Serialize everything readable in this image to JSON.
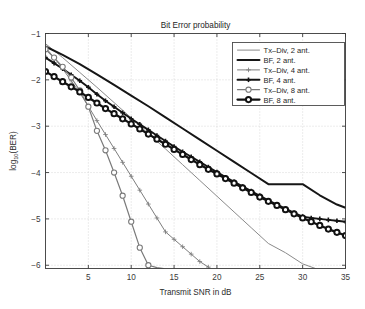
{
  "chart_data": {
    "type": "line",
    "title": "Bit Error probability",
    "xlabel": "Transmit SNR in dB",
    "ylabel": "log10(BER)",
    "ylabel_parts": {
      "base": "log",
      "sub": "10",
      "tail": "(BER)"
    },
    "xlim": [
      0,
      35
    ],
    "ylim": [
      -6.07,
      -1.0
    ],
    "xticks": [
      5,
      10,
      15,
      20,
      25,
      30,
      35
    ],
    "xtick_labels": [
      "5",
      "10",
      "15",
      "20",
      "25",
      "30",
      "35"
    ],
    "yticks": [
      -1,
      -2,
      -3,
      -4,
      -5,
      -6
    ],
    "ytick_labels": [
      "-1",
      "-2",
      "-3",
      "-4",
      "-5",
      "-6"
    ],
    "grid": true,
    "grid_style": "dotted",
    "grid_color": "#c8c8c8",
    "legend_position": "upper right",
    "series": [
      {
        "name": "Tx-Div, 2 ant.",
        "color": "#8a8a8a",
        "width": 1.0,
        "marker": "none",
        "x": [
          0,
          2,
          4,
          6,
          8,
          10,
          12,
          14,
          16,
          18,
          20,
          22,
          24,
          26,
          28,
          30,
          31.5
        ],
        "values": [
          -1.22,
          -1.52,
          -1.84,
          -2.16,
          -2.49,
          -2.82,
          -3.16,
          -3.49,
          -3.83,
          -4.17,
          -4.51,
          -4.85,
          -5.19,
          -5.53,
          -5.73,
          -5.97,
          -6.07
        ]
      },
      {
        "name": "BF, 2 ant.",
        "color": "#161616",
        "width": 2.0,
        "marker": "none",
        "x": [
          0,
          2,
          4,
          6,
          8,
          10,
          12,
          14,
          16,
          18,
          20,
          22,
          24,
          26,
          28,
          30,
          32,
          34,
          35
        ],
        "values": [
          -1.28,
          -1.46,
          -1.66,
          -1.88,
          -2.11,
          -2.34,
          -2.57,
          -2.81,
          -3.05,
          -3.29,
          -3.53,
          -3.77,
          -4.01,
          -4.25,
          -4.25,
          -4.25,
          -4.49,
          -4.69,
          -4.76
        ]
      },
      {
        "name": "Tx-Div, 4 ant.",
        "color": "#7d7d7d",
        "width": 1.0,
        "marker": "plus",
        "x": [
          0,
          1,
          2,
          3,
          4,
          5,
          6,
          7,
          8,
          9,
          10,
          11,
          12,
          13,
          14,
          15,
          16,
          17,
          18,
          19,
          19.2
        ],
        "values": [
          -1.3,
          -1.52,
          -1.76,
          -2.02,
          -2.28,
          -2.57,
          -2.88,
          -3.18,
          -3.48,
          -3.78,
          -4.08,
          -4.38,
          -4.68,
          -4.98,
          -5.28,
          -5.44,
          -5.6,
          -5.76,
          -5.92,
          -6.04,
          -6.07
        ]
      },
      {
        "name": "BF, 4 ant.",
        "color": "#141414",
        "width": 1.9,
        "marker": "plus",
        "x": [
          0,
          1,
          2,
          3,
          4,
          5,
          6,
          7,
          8,
          9,
          10,
          11,
          12,
          13,
          14,
          15,
          16,
          17,
          18,
          19,
          20,
          21,
          22,
          23,
          24,
          25,
          26,
          27,
          28,
          29,
          30,
          31,
          32,
          33,
          34,
          35
        ],
        "values": [
          -1.52,
          -1.64,
          -1.76,
          -1.89,
          -2.02,
          -2.16,
          -2.31,
          -2.45,
          -2.58,
          -2.71,
          -2.84,
          -2.96,
          -3.08,
          -3.2,
          -3.32,
          -3.44,
          -3.55,
          -3.66,
          -3.77,
          -3.88,
          -3.99,
          -4.1,
          -4.2,
          -4.3,
          -4.4,
          -4.5,
          -4.6,
          -4.69,
          -4.78,
          -4.87,
          -4.95,
          -4.98,
          -5.0,
          -5.02,
          -5.04,
          -5.06
        ]
      },
      {
        "name": "Tx-Div, 8 ant.",
        "color": "#7a7a7a",
        "width": 1.2,
        "marker": "circle",
        "x": [
          0,
          1,
          2,
          3,
          4,
          5,
          6,
          7,
          8,
          9,
          10,
          11,
          12,
          13,
          13.8
        ],
        "values": [
          -1.34,
          -1.52,
          -1.72,
          -1.95,
          -2.23,
          -2.58,
          -3.1,
          -3.52,
          -4.0,
          -4.5,
          -5.06,
          -5.62,
          -6.0,
          -6.05,
          -6.07
        ]
      },
      {
        "name": "BF, 8 ant.",
        "color": "#111111",
        "width": 2.2,
        "marker": "circle",
        "x": [
          0,
          1,
          2,
          3,
          4,
          5,
          6,
          7,
          8,
          9,
          10,
          11,
          12,
          13,
          14,
          15,
          16,
          17,
          18,
          19,
          20,
          21,
          22,
          23,
          24,
          25,
          26,
          27,
          28,
          29,
          30,
          31,
          32,
          33,
          34,
          35
        ],
        "values": [
          -1.82,
          -1.93,
          -2.04,
          -2.15,
          -2.26,
          -2.38,
          -2.5,
          -2.62,
          -2.73,
          -2.84,
          -2.95,
          -3.06,
          -3.17,
          -3.28,
          -3.39,
          -3.5,
          -3.61,
          -3.72,
          -3.83,
          -3.93,
          -4.03,
          -4.13,
          -4.23,
          -4.33,
          -4.43,
          -4.53,
          -4.62,
          -4.71,
          -4.8,
          -4.89,
          -4.98,
          -5.06,
          -5.14,
          -5.22,
          -5.29,
          -5.36
        ]
      }
    ]
  },
  "legend": {
    "items": [
      {
        "label": "Tx-Div, 2 ant."
      },
      {
        "label": "BF, 2 ant."
      },
      {
        "label": "Tx-Div, 4 ant."
      },
      {
        "label": "BF, 4 ant."
      },
      {
        "label": "Tx-Div, 8 ant."
      },
      {
        "label": "BF, 8 ant."
      }
    ]
  },
  "colors": {
    "axis": "#3a3a3a",
    "grid": "#c8c8c8",
    "background": "#ffffff",
    "legend_border": "#4a4a4a"
  }
}
